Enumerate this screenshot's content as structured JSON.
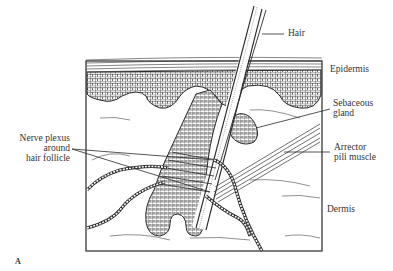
{
  "figure": {
    "panel_label": "A",
    "labels": {
      "hair": "Hair",
      "epidermis": "Epidermis",
      "sebaceous_gland_line1": "Sebaceous",
      "sebaceous_gland_line2": "gland",
      "arrector_line1": "Arrector",
      "arrector_line2": "pili muscle",
      "dermis": "Dermis",
      "nerve_line1": "Nerve plexus",
      "nerve_line2": "around",
      "nerve_line3": "hair follicle"
    },
    "colors": {
      "ink": "#2a2a2a",
      "paper": "#ffffff"
    }
  }
}
